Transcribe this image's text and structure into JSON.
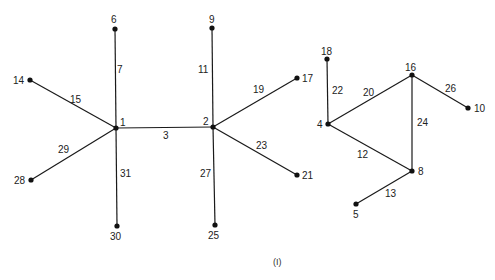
{
  "caption": "(I)",
  "nodes": [
    {
      "id": "1",
      "x": 116,
      "y": 128,
      "lx": 120,
      "ly": 126
    },
    {
      "id": "2",
      "x": 213,
      "y": 127,
      "lx": 203,
      "ly": 125
    },
    {
      "id": "6",
      "x": 115,
      "y": 29,
      "lx": 111,
      "ly": 23
    },
    {
      "id": "14",
      "x": 30,
      "y": 80,
      "lx": 13,
      "ly": 84
    },
    {
      "id": "28",
      "x": 31,
      "y": 180,
      "lx": 14,
      "ly": 184
    },
    {
      "id": "30",
      "x": 117,
      "y": 226,
      "lx": 110,
      "ly": 240
    },
    {
      "id": "9",
      "x": 212,
      "y": 28,
      "lx": 209,
      "ly": 23
    },
    {
      "id": "17",
      "x": 297,
      "y": 78,
      "lx": 302,
      "ly": 82
    },
    {
      "id": "21",
      "x": 297,
      "y": 175,
      "lx": 302,
      "ly": 179
    },
    {
      "id": "25",
      "x": 215,
      "y": 225,
      "lx": 208,
      "ly": 239
    },
    {
      "id": "18",
      "x": 327,
      "y": 59,
      "lx": 321,
      "ly": 55
    },
    {
      "id": "16",
      "x": 412,
      "y": 75,
      "lx": 405,
      "ly": 71
    },
    {
      "id": "10",
      "x": 468,
      "y": 108,
      "lx": 474,
      "ly": 112
    },
    {
      "id": "4",
      "x": 328,
      "y": 124,
      "lx": 317,
      "ly": 128
    },
    {
      "id": "8",
      "x": 412,
      "y": 171,
      "lx": 418,
      "ly": 175
    },
    {
      "id": "5",
      "x": 356,
      "y": 204,
      "lx": 353,
      "ly": 218
    }
  ],
  "edges": [
    {
      "from": "1",
      "to": "2",
      "label": "3",
      "lx": 163,
      "ly": 139
    },
    {
      "from": "1",
      "to": "6",
      "label": "7",
      "lx": 117,
      "ly": 73
    },
    {
      "from": "1",
      "to": "14",
      "label": "15",
      "lx": 70,
      "ly": 103
    },
    {
      "from": "1",
      "to": "28",
      "label": "29",
      "lx": 58,
      "ly": 153
    },
    {
      "from": "1",
      "to": "30",
      "label": "31",
      "lx": 120,
      "ly": 177
    },
    {
      "from": "2",
      "to": "9",
      "label": "11",
      "lx": 198,
      "ly": 73
    },
    {
      "from": "2",
      "to": "17",
      "label": "19",
      "lx": 253,
      "ly": 93
    },
    {
      "from": "2",
      "to": "21",
      "label": "23",
      "lx": 256,
      "ly": 149
    },
    {
      "from": "2",
      "to": "25",
      "label": "27",
      "lx": 200,
      "ly": 177
    },
    {
      "from": "4",
      "to": "18",
      "label": "22",
      "lx": 332,
      "ly": 94
    },
    {
      "from": "4",
      "to": "16",
      "label": "20",
      "lx": 363,
      "ly": 96
    },
    {
      "from": "4",
      "to": "8",
      "label": "12",
      "lx": 357,
      "ly": 158
    },
    {
      "from": "16",
      "to": "8",
      "label": "24",
      "lx": 417,
      "ly": 126
    },
    {
      "from": "16",
      "to": "10",
      "label": "26",
      "lx": 445,
      "ly": 92
    },
    {
      "from": "8",
      "to": "5",
      "label": "13",
      "lx": 385,
      "ly": 197
    }
  ]
}
